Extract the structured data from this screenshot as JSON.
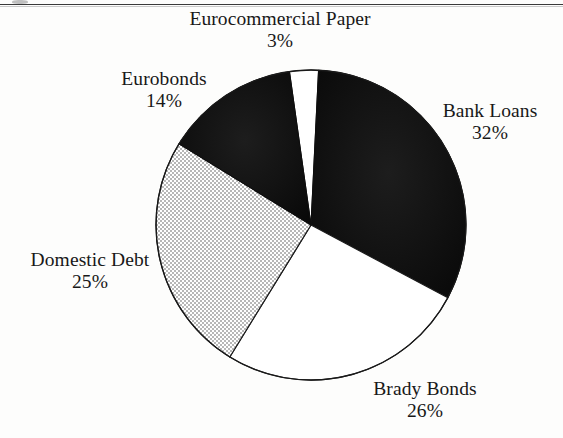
{
  "page": {
    "background_color": "#fdfdfc",
    "rule_color": "#3a3a3a"
  },
  "chart_data": {
    "type": "pie",
    "title": "",
    "subtitle": "",
    "xlabel": "",
    "ylabel": "",
    "legend_position": "none",
    "grid": false,
    "units": "percent",
    "total": 100,
    "start_angle_deg": -8,
    "direction": "clockwise",
    "categories": [
      "Eurocommercial Paper",
      "Bank Loans",
      "Brady Bonds",
      "Domestic Debt",
      "Eurobonds"
    ],
    "values": [
      3,
      32,
      26,
      25,
      14
    ],
    "slices": [
      {
        "label": "Eurocommercial Paper",
        "value": 3,
        "value_text": "3%",
        "fill": "#ffffff",
        "stroke": "#1a1a1a",
        "pattern": "solid-white"
      },
      {
        "label": "Bank Loans",
        "value": 32,
        "value_text": "32%",
        "fill": "#111111",
        "stroke": "#111111",
        "pattern": "solid-black"
      },
      {
        "label": "Brady Bonds",
        "value": 26,
        "value_text": "26%",
        "fill": "#ffffff",
        "stroke": "#1a1a1a",
        "pattern": "solid-white"
      },
      {
        "label": "Domestic Debt",
        "value": 25,
        "value_text": "25%",
        "fill": "#d9d9d9",
        "stroke": "#1a1a1a",
        "pattern": "fine-checker-gray"
      },
      {
        "label": "Eurobonds",
        "value": 14,
        "value_text": "14%",
        "fill": "#111111",
        "stroke": "#111111",
        "pattern": "solid-black"
      }
    ],
    "geometry": {
      "center_x": 311,
      "center_y": 225,
      "radius": 155
    }
  },
  "labels": {
    "eurocommercial_paper": {
      "name": "Eurocommercial Paper",
      "percent": "3%"
    },
    "eurobonds": {
      "name": "Eurobonds",
      "percent": "14%"
    },
    "bank_loans": {
      "name": "Bank Loans",
      "percent": "32%"
    },
    "domestic_debt": {
      "name": "Domestic Debt",
      "percent": "25%"
    },
    "brady_bonds": {
      "name": "Brady Bonds",
      "percent": "26%"
    }
  }
}
